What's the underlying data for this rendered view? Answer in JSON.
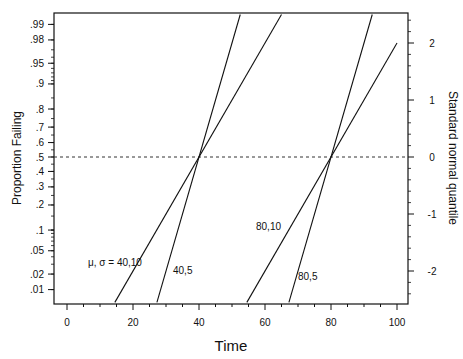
{
  "chart_data": {
    "type": "line",
    "title": "",
    "xlabel": "Time",
    "ylabel": "Proportion Failing",
    "y2label": "Standard normal quantile",
    "xlim": [
      0,
      100
    ],
    "x_ticks": [
      "0",
      "20",
      "40",
      "60",
      "80",
      "100"
    ],
    "y_ticks": [
      ".01",
      ".02",
      ".05",
      ".1",
      ".2",
      ".3",
      ".4",
      ".5",
      ".6",
      ".7",
      ".8",
      ".9",
      ".95",
      ".98",
      ".99"
    ],
    "y2_ticks": [
      "-2",
      "-1",
      "0",
      "1",
      "2"
    ],
    "grid": false,
    "reference_line": {
      "y_quantile": 0,
      "style": "dashed",
      "label": ".5"
    },
    "series": [
      {
        "name": "μ, σ = 40,10",
        "mu": 40,
        "sigma": 10,
        "label": "μ, σ = 40,10"
      },
      {
        "name": "40,5",
        "mu": 40,
        "sigma": 5,
        "label": "40,5"
      },
      {
        "name": "80,10",
        "mu": 80,
        "sigma": 10,
        "label": "80,10"
      },
      {
        "name": "80,5",
        "mu": 80,
        "sigma": 5,
        "label": "80,5"
      }
    ]
  }
}
